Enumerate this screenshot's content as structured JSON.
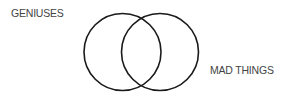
{
  "diagram": {
    "type": "venn",
    "sets": [
      {
        "id": "left",
        "label": "GENIUSES"
      },
      {
        "id": "right",
        "label": "MAD THINGS"
      }
    ],
    "colors": {
      "stroke": "#1a1a1a",
      "text": "#444444",
      "background": "#ffffff"
    }
  }
}
